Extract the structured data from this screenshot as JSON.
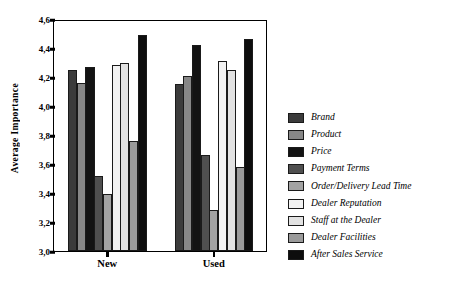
{
  "chart_data": {
    "type": "bar",
    "title": "",
    "xlabel": "",
    "ylabel": "Average Importance",
    "ylim": [
      3.0,
      4.6
    ],
    "ytick_step": 0.2,
    "decimal_separator": ",",
    "grid": false,
    "legend_position": "right",
    "categories": [
      "New",
      "Used"
    ],
    "ytick_labels": [
      "4,6",
      "4,4",
      "4,2",
      "4,0",
      "3,8",
      "3,6",
      "3,4",
      "3,2",
      "3,0"
    ],
    "ytick_values": [
      4.6,
      4.4,
      4.2,
      4.0,
      3.8,
      3.6,
      3.4,
      3.2,
      3.0
    ],
    "series": [
      {
        "name": "Brand",
        "color": "#3b3b3b",
        "values": [
          4.25,
          4.15
        ]
      },
      {
        "name": "Product",
        "color": "#878787",
        "values": [
          4.16,
          4.21
        ]
      },
      {
        "name": "Price",
        "color": "#131313",
        "values": [
          4.27,
          4.42
        ]
      },
      {
        "name": "Payment Terms",
        "color": "#4f4f4f",
        "values": [
          3.52,
          3.66
        ]
      },
      {
        "name": "Order/Delivery Lead Time",
        "color": "#a3a3a3",
        "values": [
          3.39,
          3.28
        ]
      },
      {
        "name": "Dealer Reputation",
        "color": "#f2f2f2",
        "values": [
          4.28,
          4.31
        ]
      },
      {
        "name": "Staff at the Dealer",
        "color": "#e2e2e2",
        "values": [
          4.3,
          4.25
        ]
      },
      {
        "name": "Dealer Facilities",
        "color": "#9a9a9a",
        "values": [
          3.76,
          3.58
        ]
      },
      {
        "name": "After Sales Service",
        "color": "#0d0d0d",
        "values": [
          4.49,
          4.46
        ]
      }
    ]
  },
  "legend": {
    "items": [
      "Brand",
      "Product",
      "Price",
      "Payment Terms",
      "Order/Delivery Lead Time",
      "Dealer Reputation",
      "Staff at the Dealer",
      "Dealer Facilities",
      "After Sales Service"
    ]
  }
}
